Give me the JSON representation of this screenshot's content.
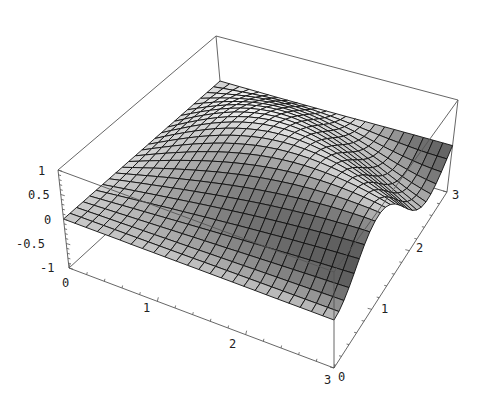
{
  "chart_data": {
    "type": "surface3d",
    "title": "",
    "function_description": "smooth saddle-like surface over [0,3]x[0,3], two peaks along the back edge separated by a dark trough, sloping down to the front",
    "x_range": [
      0,
      3
    ],
    "y_range": [
      0,
      3
    ],
    "z_range": [
      -1,
      1
    ],
    "grid_resolution": 24,
    "x_axis": {
      "label": "",
      "ticks": [
        "0",
        "1",
        "2",
        "3"
      ]
    },
    "y_axis": {
      "label": "",
      "ticks": [
        "0",
        "1",
        "2",
        "3"
      ]
    },
    "z_axis": {
      "label": "",
      "ticks": [
        "-1",
        "-0.5",
        "0",
        "0.5",
        "1"
      ]
    },
    "box": true,
    "shading": "grayscale lighting",
    "mesh": true
  },
  "labels": {
    "z": [
      "1",
      "0.5",
      "0",
      "-0.5",
      "-1"
    ],
    "x": [
      "0",
      "1",
      "2",
      "3"
    ],
    "y": [
      "0",
      "1",
      "2",
      "3"
    ]
  }
}
